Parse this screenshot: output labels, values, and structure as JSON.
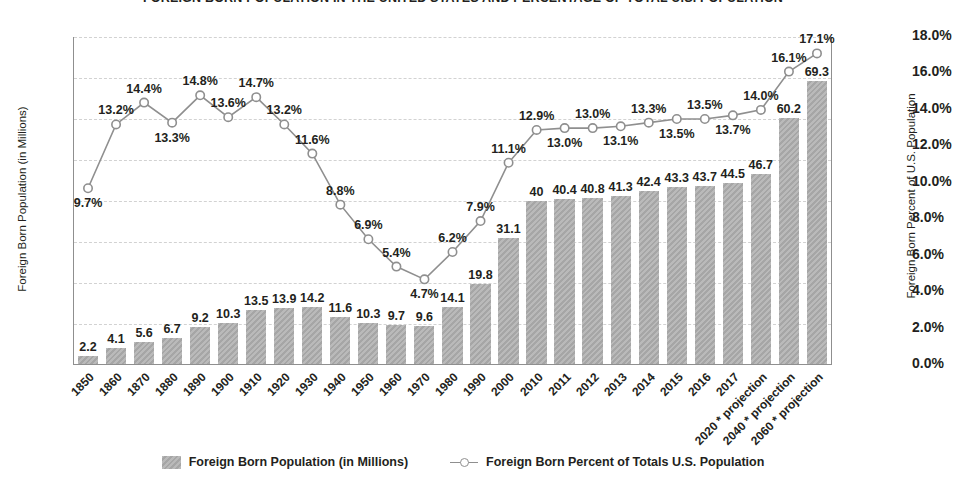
{
  "chart_data": {
    "type": "bar",
    "title": "FOREIGN BORN POPULATION IN THE UNITED STATES AND PERCENTAGE OF TOTAL U.S. POPULATION",
    "xlabel": "",
    "ylabel": "Foreign Born Population (in Millions)",
    "y2label": "Foreign Born Percent of U.S. Population",
    "ylim": [
      0,
      80
    ],
    "y2lim": [
      0,
      18
    ],
    "grid": true,
    "legend_position": "bottom",
    "categories": [
      "1850",
      "1860",
      "1870",
      "1880",
      "1890",
      "1900",
      "1910",
      "1920",
      "1930",
      "1940",
      "1950",
      "1960",
      "1970",
      "1980",
      "1990",
      "2000",
      "2010",
      "2011",
      "2012",
      "2013",
      "2014",
      "2015",
      "2016",
      "2017",
      "2020 * projection",
      "2040 * projection",
      "2060 * projection"
    ],
    "series": [
      {
        "name": "Foreign Born Population (in Millions)",
        "type": "bar",
        "axis": "left",
        "color": "#a6a6a6",
        "values": [
          2.2,
          4.1,
          5.6,
          6.7,
          9.2,
          10.3,
          13.5,
          13.9,
          14.2,
          11.6,
          10.3,
          9.7,
          9.6,
          14.1,
          19.8,
          31.1,
          40,
          40.4,
          40.8,
          41.3,
          42.4,
          43.3,
          43.7,
          44.5,
          46.7,
          60.2,
          69.3
        ],
        "labels": [
          "2.2",
          "4.1",
          "5.6",
          "6.7",
          "9.2",
          "10.3",
          "13.5",
          "13.9",
          "14.2",
          "11.6",
          "10.3",
          "9.7",
          "9.6",
          "14.1",
          "19.8",
          "31.1",
          "40",
          "40.4",
          "40.8",
          "41.3",
          "42.4",
          "43.3",
          "43.7",
          "44.5",
          "46.7",
          "60.2",
          "69.3"
        ]
      },
      {
        "name": "Foreign Born Percent of Totals U.S. Population",
        "type": "line",
        "axis": "right",
        "color": "#8f8f8f",
        "values": [
          9.7,
          13.2,
          14.4,
          13.3,
          14.8,
          13.6,
          14.7,
          13.2,
          11.6,
          8.8,
          6.9,
          5.4,
          4.7,
          6.2,
          7.9,
          11.1,
          12.9,
          13.0,
          13.0,
          13.1,
          13.3,
          13.5,
          13.5,
          13.7,
          14.0,
          16.1,
          17.1
        ],
        "labels": [
          "9.7%",
          "13.2%",
          "14.4%",
          "13.3%",
          "14.8%",
          "13.6%",
          "14.7%",
          "13.2%",
          "11.6%",
          "8.8%",
          "6.9%",
          "5.4%",
          "4.7%",
          "6.2%",
          "7.9%",
          "11.1%",
          "12.9%",
          "13.0%",
          "13.0%",
          "13.1%",
          "13.3%",
          "13.5%",
          "13.5%",
          "13.7%",
          "14.0%",
          "16.1%",
          "17.1%"
        ],
        "label_side": [
          "below",
          "above",
          "above",
          "below",
          "above",
          "above",
          "above",
          "above",
          "above",
          "above",
          "above",
          "above",
          "below",
          "above",
          "above",
          "above",
          "above",
          "below",
          "above",
          "below",
          "above",
          "below",
          "above",
          "below",
          "above",
          "above",
          "above"
        ]
      }
    ],
    "yticks_left": [
      "0",
      "10",
      "20",
      "30",
      "40",
      "50",
      "60",
      "70",
      "80"
    ],
    "yticks_right": [
      "0.0%",
      "2.0%",
      "4.0%",
      "6.0%",
      "8.0%",
      "10.0%",
      "12.0%",
      "14.0%",
      "16.0%",
      "18.0%"
    ]
  },
  "legend": {
    "bar_label": "Foreign Born Population (in Millions)",
    "line_label": "Foreign Born Percent of Totals U.S. Population"
  }
}
